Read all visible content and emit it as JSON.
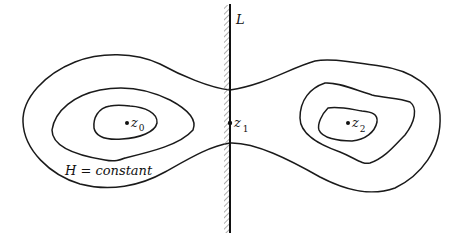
{
  "diagram": {
    "line": {
      "label": "L"
    },
    "points": [
      {
        "id": "z0",
        "label": "z",
        "subscript": "0"
      },
      {
        "id": "z1",
        "label": "z",
        "subscript": "1"
      },
      {
        "id": "z2",
        "label": "z",
        "subscript": "2"
      }
    ],
    "curve_label": "H = constant",
    "colors": {
      "stroke": "#1a1a1a",
      "background": "#ffffff",
      "hatch": "#777777"
    }
  }
}
